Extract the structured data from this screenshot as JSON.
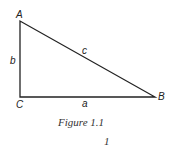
{
  "figure": {
    "vertices": {
      "A": "A",
      "B": "B",
      "C": "C"
    },
    "sides": {
      "a": "a",
      "b": "b",
      "c": "c"
    },
    "caption": "Figure 1.1",
    "page_number": "1",
    "line_color": "#222222"
  }
}
